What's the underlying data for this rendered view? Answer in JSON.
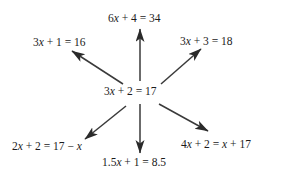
{
  "diagram": {
    "type": "equation-equivalence-star",
    "background_color": "#ffffff",
    "ink_color": "#1b1b1b",
    "center": {
      "id": "center",
      "text": "3x + 2 = 17"
    },
    "branches": [
      {
        "id": "top",
        "text": "6x + 4 = 34",
        "direction": "up",
        "arrow": {
          "x1": 140,
          "y1": 81,
          "x2": 140,
          "y2": 29
        }
      },
      {
        "id": "upper-left",
        "text": "3x + 1 = 16",
        "direction": "up-left",
        "arrow": {
          "x1": 123,
          "y1": 84,
          "x2": 72,
          "y2": 51
        }
      },
      {
        "id": "upper-right",
        "text": "3x + 3 = 18",
        "direction": "up-right",
        "arrow": {
          "x1": 161,
          "y1": 84,
          "x2": 201,
          "y2": 49
        }
      },
      {
        "id": "lower-left",
        "text": "2x + 2 = 17 − x",
        "direction": "down-left",
        "arrow": {
          "x1": 126,
          "y1": 106,
          "x2": 85,
          "y2": 139
        }
      },
      {
        "id": "bottom",
        "text": "1.5x + 1 = 8.5",
        "direction": "down",
        "arrow": {
          "x1": 140,
          "y1": 104,
          "x2": 140,
          "y2": 153
        }
      },
      {
        "id": "lower-right",
        "text": "4x + 2 = x + 17",
        "direction": "down-right",
        "arrow": {
          "x1": 159,
          "y1": 104,
          "x2": 208,
          "y2": 131
        }
      }
    ]
  }
}
